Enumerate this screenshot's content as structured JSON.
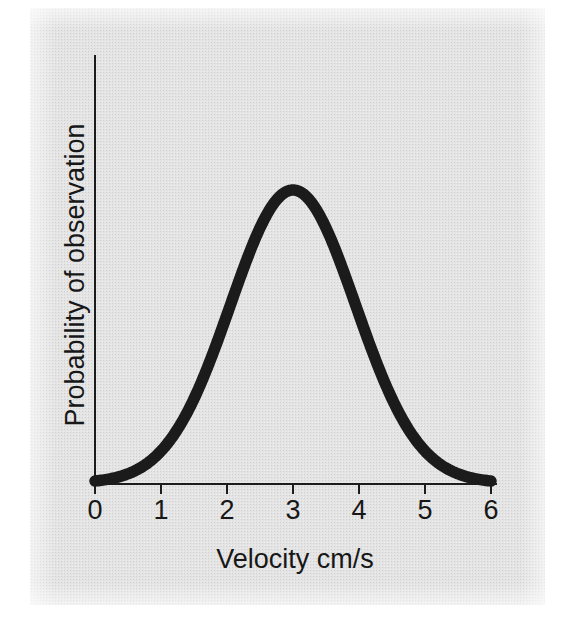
{
  "figure": {
    "background_color": "#e4e4e4",
    "page_color": "#ffffff",
    "curve_color": "#1b1b1b",
    "axis_color": "#1c1c1c"
  },
  "chart_data": {
    "type": "line",
    "title": "",
    "subtitle": "",
    "xlabel": "Velocity cm/s",
    "ylabel": "Probability of observation",
    "xlim": [
      0,
      6
    ],
    "ylim": [
      0,
      1
    ],
    "grid": false,
    "legend": false,
    "legend_position": "none",
    "xticks": [
      0,
      1,
      2,
      3,
      4,
      5,
      6
    ],
    "xtick_labels": [
      "0",
      "1",
      "2",
      "3",
      "4",
      "5",
      "6"
    ],
    "yticks": [],
    "ytick_labels": [],
    "annotations": [],
    "distribution": {
      "shape": "gaussian",
      "mean": 3.0,
      "std_dev": 0.95,
      "peak_x": 3.0,
      "peak_y": 1.0
    },
    "series": [
      {
        "name": "Probability of observation",
        "color": "#1b1b1b",
        "line_width": 11.5,
        "x": [
          0.0,
          0.2,
          0.4,
          0.6,
          0.8,
          1.0,
          1.2,
          1.4,
          1.6,
          1.8,
          2.0,
          2.2,
          2.4,
          2.6,
          2.8,
          3.0,
          3.2,
          3.4,
          3.6,
          3.8,
          4.0,
          4.2,
          4.4,
          4.6,
          4.8,
          5.0,
          5.2,
          5.4,
          5.6,
          5.8,
          6.0
        ],
        "y": [
          0.007,
          0.014,
          0.027,
          0.049,
          0.083,
          0.133,
          0.201,
          0.288,
          0.391,
          0.503,
          0.614,
          0.717,
          0.83,
          0.905,
          0.976,
          1.0,
          0.976,
          0.905,
          0.83,
          0.717,
          0.614,
          0.503,
          0.391,
          0.288,
          0.201,
          0.133,
          0.083,
          0.049,
          0.027,
          0.014,
          0.007
        ]
      }
    ]
  }
}
